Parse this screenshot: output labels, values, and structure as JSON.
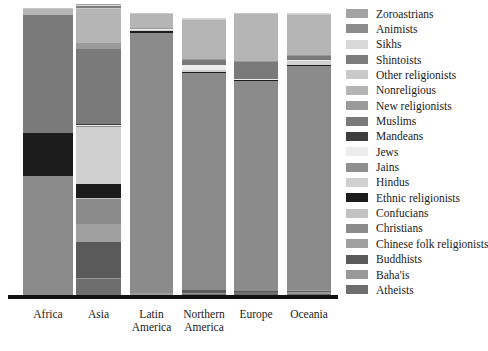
{
  "chart_data": {
    "type": "bar",
    "subtype": "stacked-percentage",
    "title": "",
    "subtitle": "",
    "xlabel": "",
    "ylabel": "",
    "ylim": [
      0,
      100
    ],
    "grid": false,
    "legend_position": "right",
    "orientation": "vertical",
    "stack_order": "top-to-bottom",
    "categories": [
      "Africa",
      "Asia",
      "Latin America",
      "Northern America",
      "Europe",
      "Oceania"
    ],
    "category_labels": [
      {
        "line1": "Africa",
        "line2": ""
      },
      {
        "line1": "Asia",
        "line2": ""
      },
      {
        "line1": "Latin",
        "line2": "America"
      },
      {
        "line1": "Northern",
        "line2": "America"
      },
      {
        "line1": "Europe",
        "line2": ""
      },
      {
        "line1": "Oceania",
        "line2": ""
      }
    ],
    "series": [
      {
        "name": "Zoroastrians",
        "color": "#a3a3a3",
        "values": [
          0.0,
          0.2,
          0.0,
          0.0,
          0.0,
          0.0
        ]
      },
      {
        "name": "Animists",
        "color": "#8c8c8c",
        "values": [
          0.0,
          0.0,
          0.0,
          0.0,
          0.0,
          0.0
        ]
      },
      {
        "name": "Sikhs",
        "color": "#d8d8d8",
        "values": [
          0.0,
          0.6,
          0.0,
          0.2,
          0.1,
          0.3
        ]
      },
      {
        "name": "Shintoists",
        "color": "#7d7d7d",
        "values": [
          0.0,
          0.7,
          0.0,
          0.0,
          0.0,
          0.0
        ]
      },
      {
        "name": "Other religionists",
        "color": "#c9c9c9",
        "values": [
          0.3,
          0.3,
          0.3,
          0.5,
          0.4,
          0.5
        ]
      },
      {
        "name": "Nonreligious",
        "color": "#b5b5b5",
        "values": [
          2.0,
          11.5,
          5.0,
          14.0,
          16.5,
          14.0
        ]
      },
      {
        "name": "New religionists",
        "color": "#9a9a9a",
        "values": [
          0.1,
          2.2,
          0.2,
          0.5,
          0.2,
          0.3
        ]
      },
      {
        "name": "Muslims",
        "color": "#7a7a7a",
        "values": [
          41.0,
          25.5,
          0.3,
          1.6,
          6.0,
          1.5
        ]
      },
      {
        "name": "Mandeans",
        "color": "#3d3d3d",
        "values": [
          0.0,
          0.1,
          0.0,
          0.0,
          0.0,
          0.0
        ]
      },
      {
        "name": "Jews",
        "color": "#ececec",
        "values": [
          0.0,
          0.5,
          0.3,
          2.0,
          0.3,
          0.3
        ]
      },
      {
        "name": "Jains",
        "color": "#8f8f8f",
        "values": [
          0.0,
          0.2,
          0.0,
          0.0,
          0.0,
          0.0
        ]
      },
      {
        "name": "Hindus",
        "color": "#d0d0d0",
        "values": [
          0.1,
          19.5,
          0.2,
          0.6,
          0.3,
          1.5
        ]
      },
      {
        "name": "Ethnic religionists",
        "color": "#1c1c1c",
        "values": [
          15.0,
          5.0,
          0.8,
          0.3,
          0.2,
          0.5
        ]
      },
      {
        "name": "Confucians",
        "color": "#c2c2c2",
        "values": [
          0.0,
          0.2,
          0.0,
          0.0,
          0.0,
          0.0
        ]
      },
      {
        "name": "Christians",
        "color": "#8b8b8b",
        "values": [
          41.0,
          8.5,
          92.0,
          78.0,
          74.0,
          79.0
        ]
      },
      {
        "name": "Chinese folk religionists",
        "color": "#9f9f9f",
        "values": [
          0.0,
          6.0,
          0.1,
          0.2,
          0.1,
          0.3
        ]
      },
      {
        "name": "Buddhists",
        "color": "#5a5a5a",
        "values": [
          0.1,
          12.5,
          0.2,
          0.9,
          0.3,
          0.5
        ]
      },
      {
        "name": "Baha'is",
        "color": "#989898",
        "values": [
          0.3,
          0.4,
          0.2,
          0.4,
          0.1,
          0.6
        ]
      },
      {
        "name": "Atheists",
        "color": "#6e6e6e",
        "values": [
          0.1,
          5.6,
          0.4,
          0.8,
          1.4,
          0.7
        ]
      }
    ]
  },
  "legend": {
    "items": [
      {
        "label": "Zoroastrians",
        "color": "#a3a3a3"
      },
      {
        "label": "Animists",
        "color": "#8c8c8c"
      },
      {
        "label": "Sikhs",
        "color": "#d8d8d8"
      },
      {
        "label": "Shintoists",
        "color": "#7d7d7d"
      },
      {
        "label": "Other religionists",
        "color": "#c9c9c9"
      },
      {
        "label": "Nonreligious",
        "color": "#b5b5b5"
      },
      {
        "label": "New religionists",
        "color": "#9a9a9a"
      },
      {
        "label": "Muslims",
        "color": "#7a7a7a"
      },
      {
        "label": "Mandeans",
        "color": "#3d3d3d"
      },
      {
        "label": "Jews",
        "color": "#ececec"
      },
      {
        "label": "Jains",
        "color": "#8f8f8f"
      },
      {
        "label": "Hindus",
        "color": "#d0d0d0"
      },
      {
        "label": "Ethnic religionists",
        "color": "#1c1c1c"
      },
      {
        "label": "Confucians",
        "color": "#c2c2c2"
      },
      {
        "label": "Christians",
        "color": "#8b8b8b"
      },
      {
        "label": "Chinese folk religionists",
        "color": "#9f9f9f"
      },
      {
        "label": "Buddhists",
        "color": "#5a5a5a"
      },
      {
        "label": "Baha'is",
        "color": "#989898"
      },
      {
        "label": "Atheists",
        "color": "#6e6e6e"
      }
    ]
  },
  "axis": {
    "baseline_color": "#111111"
  }
}
